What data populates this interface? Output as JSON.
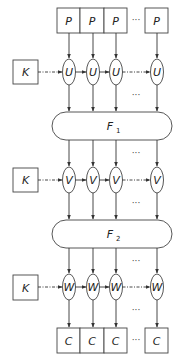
{
  "diagram": {
    "inputs": {
      "row_label": "P",
      "cells": [
        "P",
        "P",
        "P",
        "P"
      ],
      "ellipsis": "···"
    },
    "key_labels": [
      "K",
      "K",
      "K"
    ],
    "stage1": {
      "unit_label": "U",
      "units": [
        "U",
        "U",
        "U",
        "U"
      ],
      "ellipsis": "···"
    },
    "mix1": {
      "label": "F",
      "subscript": "1"
    },
    "stage2": {
      "unit_label": "V",
      "units": [
        "V",
        "V",
        "V",
        "V"
      ],
      "ellipsis": "···"
    },
    "mix2": {
      "label": "F",
      "subscript": "2"
    },
    "stage3": {
      "unit_label": "W",
      "units": [
        "W",
        "W",
        "W",
        "W"
      ],
      "ellipsis": "···"
    },
    "outputs": {
      "cells": [
        "C",
        "C",
        "C",
        "C"
      ],
      "ellipsis": "···"
    },
    "colors": {
      "stroke": "#333333",
      "background": "#ffffff"
    }
  }
}
